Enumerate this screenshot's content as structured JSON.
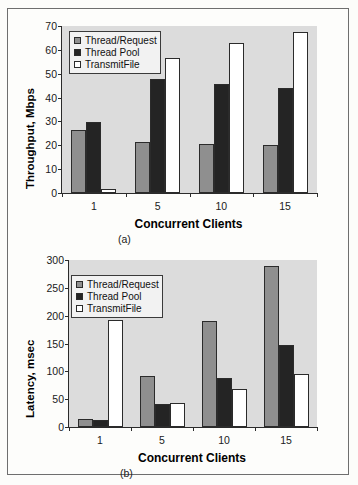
{
  "figure": {
    "caption_a": "(a)",
    "caption_b": "(b)"
  },
  "colors": {
    "series_thread_request": "#8f8f8f",
    "series_thread_pool": "#242424",
    "series_transmitfile": "#ffffff",
    "plot_background": "#dcdcdc",
    "axis": "#2b2b2b",
    "page_background": "#fdfdfb"
  },
  "chart_data": [
    {
      "type": "bar",
      "title": "",
      "panel": "(a)",
      "categories": [
        "1",
        "5",
        "10",
        "15"
      ],
      "series": [
        {
          "name": "Thread/Request",
          "values": [
            26.5,
            21.5,
            20.5,
            20.2
          ],
          "color": "#8f8f8f"
        },
        {
          "name": "Thread Pool",
          "values": [
            29.8,
            48.0,
            45.5,
            44.0
          ],
          "color": "#242424"
        },
        {
          "name": "TransmitFile",
          "values": [
            1.8,
            56.5,
            63.0,
            67.5
          ],
          "color": "#ffffff"
        }
      ],
      "xlabel": "Concurrent Clients",
      "ylabel": "Throughput, Mbps",
      "ylim": [
        0,
        70
      ],
      "yticks": [
        0,
        10,
        20,
        30,
        40,
        50,
        60,
        70
      ],
      "grid": false,
      "legend_position": "top-left"
    },
    {
      "type": "bar",
      "title": "",
      "panel": "(b)",
      "categories": [
        "1",
        "5",
        "10",
        "15"
      ],
      "series": [
        {
          "name": "Thread/Request",
          "values": [
            14,
            91,
            190,
            289
          ],
          "color": "#8f8f8f"
        },
        {
          "name": "Thread Pool",
          "values": [
            12,
            41,
            88,
            147
          ],
          "color": "#242424"
        },
        {
          "name": "TransmitFile",
          "values": [
            192,
            43,
            69,
            95
          ],
          "color": "#ffffff"
        }
      ],
      "xlabel": "Concurrent Clients",
      "ylabel": "Latency, msec",
      "ylim": [
        0,
        300
      ],
      "yticks": [
        0,
        50,
        100,
        150,
        200,
        250,
        300
      ],
      "grid": false,
      "legend_position": "top-left"
    }
  ]
}
